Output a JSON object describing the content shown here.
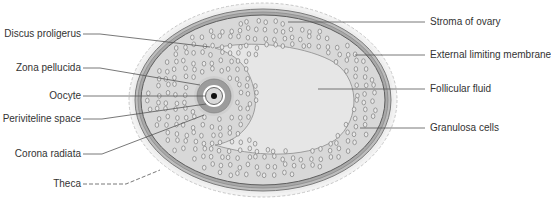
{
  "colors": {
    "stroma_fill": "#ececec",
    "stroma_edge": "#b8b8b8",
    "theca_band": "#8a8a8a",
    "theca_band_light": "#c4c4c4",
    "granulosa_fill": "#d6d6d6",
    "cell_fill": "#e8e8e8",
    "cell_stroke": "#6e6e6e",
    "fluid_fill": "#e4e4e4",
    "zona_ring": "#9a9a9a",
    "oocyte_fill": "#d9d9d9",
    "nucleus": "#111111",
    "leader_line": "#555555",
    "text": "#333333"
  },
  "labels_left": [
    {
      "id": "discus-proligerus",
      "text": "Discus proligerus",
      "y": 34
    },
    {
      "id": "zona-pellucida",
      "text": "Zona pellucida",
      "y": 68
    },
    {
      "id": "oocyte",
      "text": "Oocyte",
      "y": 96
    },
    {
      "id": "periviteline-space",
      "text": "Periviteline space",
      "y": 119
    },
    {
      "id": "corona-radiata",
      "text": "Corona radiata",
      "y": 154
    },
    {
      "id": "theca",
      "text": "Theca",
      "y": 184
    }
  ],
  "labels_right": [
    {
      "id": "stroma-of-ovary",
      "text": "Stroma of ovary",
      "y": 22
    },
    {
      "id": "external-limiting-membrane",
      "text": "External limiting membrane",
      "y": 55
    },
    {
      "id": "follicular-fluid",
      "text": "Follicular fluid",
      "y": 89
    },
    {
      "id": "granulosa-cells",
      "text": "Granulosa cells",
      "y": 128
    }
  ]
}
